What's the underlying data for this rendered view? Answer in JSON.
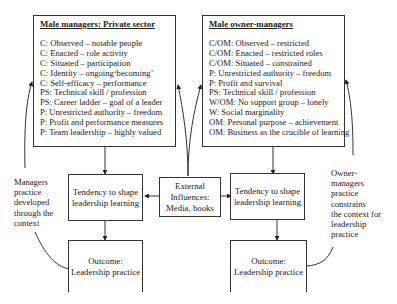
{
  "left_panel": {
    "title": "Male managers: Private sector",
    "items": [
      "C: Observed – notable people",
      "C: Enacted – role activity",
      "C: Situated – participation",
      "C: Identity – ongoing‘becoming’",
      "C: Self-efficacy – performance",
      "PS: Technical skill / profession",
      "PS: Career ladder – goal of a leader",
      "P: Unrestricted authority – freedom",
      "P: Profit and performance measures",
      "P: Team leadership – highly valued"
    ]
  },
  "right_panel": {
    "title": "Male owner-managers",
    "items": [
      "C/OM: Observed – restricted",
      "C/OM: Enacted – restricted roles",
      "C/OM: Situated – constrained",
      "P: Unrestricted authority – freedom",
      "P: Profit and survival",
      "PS: Technical skill / profession",
      "W/OM: No support group – lonely",
      "W: Social marginality",
      "OM: Personal purpose – achievement",
      "OM: Business as the crucible of learning"
    ]
  },
  "left_tendency": {
    "line1": "Tendency to shape",
    "line2": "leadership learning"
  },
  "right_tendency": {
    "line1": "Tendency to shape",
    "line2": "leadership learning"
  },
  "external": {
    "line1": "External",
    "line2": "Influences:",
    "line3": "Media, books"
  },
  "left_outcome": {
    "line1": "Outcome:",
    "line2": "Leadership practice"
  },
  "right_outcome": {
    "line1": "Outcome:",
    "line2": "Leadership practice"
  },
  "left_note": [
    "Managers",
    "practice",
    "developed",
    "through the",
    "context"
  ],
  "right_note": [
    "Owner-",
    "managers",
    "practice",
    "constrains",
    "the context for",
    "leadership",
    "practice"
  ]
}
